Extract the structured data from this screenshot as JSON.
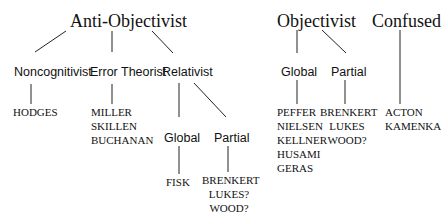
{
  "diagram": {
    "roots": [
      {
        "label": "Anti-Objectivist"
      },
      {
        "label": "Objectivist"
      },
      {
        "label": "Confused"
      }
    ],
    "anti_objectivist": {
      "noncognitivist": {
        "label": "Noncognitivist",
        "members": [
          "HODGES"
        ]
      },
      "error_theorist": {
        "label": "Error Theorist",
        "members": [
          "MILLER",
          "SKILLEN",
          "BUCHANAN"
        ]
      },
      "relativist": {
        "label": "Relativist",
        "global": {
          "label": "Global",
          "members": [
            "FISK"
          ]
        },
        "partial": {
          "label": "Partial",
          "members": [
            "BRENKERT",
            "LUKES?",
            "WOOD?"
          ]
        }
      }
    },
    "objectivist": {
      "global": {
        "label": "Global",
        "members": [
          "PEFFER",
          "NIELSEN",
          "KELLNER",
          "HUSAMI",
          "GERAS"
        ]
      },
      "partial": {
        "label": "Partial",
        "members": [
          "BRENKERT",
          "LUKES",
          "WOOD?"
        ]
      }
    },
    "confused": {
      "members": [
        "ACTON",
        "KAMENKA"
      ]
    }
  }
}
